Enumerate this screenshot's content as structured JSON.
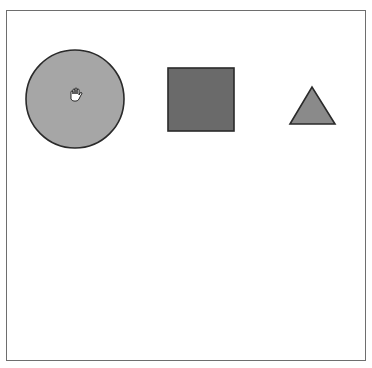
{
  "canvas": {
    "background": "#ffffff",
    "border_color": "#6e6e6e"
  },
  "shapes": [
    {
      "type": "circle",
      "name": "circle",
      "fill": "#a6a6a6",
      "stroke": "#2a2a2a"
    },
    {
      "type": "square",
      "name": "square",
      "fill": "#6a6a6a",
      "stroke": "#2a2a2a"
    },
    {
      "type": "triangle",
      "name": "triangle",
      "fill": "#8a8a8a",
      "stroke": "#2a2a2a"
    }
  ],
  "cursor": {
    "icon": "hand-grab-icon"
  }
}
